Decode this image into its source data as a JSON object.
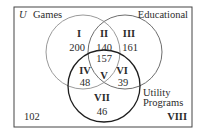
{
  "diagram": {
    "type": "venn-3-set",
    "universe": {
      "label": "U",
      "outside_count": "102",
      "outside_region": "VIII"
    },
    "sets": [
      {
        "name": "Games",
        "color": "#9a9a9a"
      },
      {
        "name": "Educational",
        "color": "#6e6e6e"
      },
      {
        "name": "Utility Programs",
        "line1": "Utility",
        "line2": "Programs",
        "color": "#1e1e1e"
      }
    ],
    "regions": [
      {
        "id": "I",
        "count": "200",
        "description": "Games only"
      },
      {
        "id": "II",
        "count": "140",
        "description": "Games and Educational only"
      },
      {
        "id": "III",
        "count": "161",
        "description": "Educational only"
      },
      {
        "id": "IV",
        "count": "48",
        "description": "Games and Utility only"
      },
      {
        "id": "V",
        "count": "157",
        "description": "All three"
      },
      {
        "id": "VI",
        "count": "39",
        "description": "Educational and Utility only"
      },
      {
        "id": "VII",
        "count": "46",
        "description": "Utility only"
      },
      {
        "id": "VIII",
        "count": "102",
        "description": "None"
      }
    ]
  }
}
